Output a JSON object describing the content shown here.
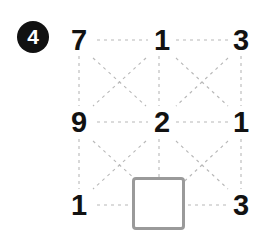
{
  "badge": {
    "label": "4"
  },
  "grid": {
    "rows": [
      {
        "cells": [
          {
            "value": "7"
          },
          {
            "value": "1"
          },
          {
            "value": "3"
          }
        ]
      },
      {
        "cells": [
          {
            "value": "9"
          },
          {
            "value": "2"
          },
          {
            "value": "1"
          }
        ]
      },
      {
        "cells": [
          {
            "value": "1"
          },
          {
            "value": ""
          },
          {
            "value": "3"
          }
        ]
      }
    ]
  },
  "answer_box": {
    "value": "",
    "placeholder": ""
  },
  "colors": {
    "badge_background": "#111111",
    "badge_text": "#ffffff",
    "number_text": "#121212",
    "connector_line": "#b8b8b8",
    "answer_box_border": "#9a9a9a",
    "page_background": "#ffffff"
  }
}
